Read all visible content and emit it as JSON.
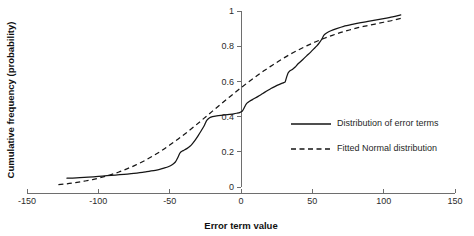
{
  "chart_data": {
    "type": "line",
    "title": "",
    "xlabel": "Error term value",
    "ylabel": "Cumulative frequency (probability)",
    "xlim": [
      -150,
      150
    ],
    "ylim": [
      0,
      1
    ],
    "xticks": [
      -150,
      -100,
      -50,
      0,
      50,
      100,
      150
    ],
    "xticklabels": [
      "-150",
      "-100",
      "-50",
      "0",
      "50",
      "100",
      "150"
    ],
    "yticks": [
      0,
      0.2,
      0.4,
      0.6,
      0.8,
      1
    ],
    "yticklabels": [
      "0",
      "0.2",
      "0.4",
      "0.6",
      "0.8",
      "1"
    ],
    "grid": false,
    "legend_position": "center-right",
    "line_color": "#151515",
    "axis_color": "#6e6e6e",
    "series": [
      {
        "name": "Distribution of error terms",
        "style": "solid",
        "x": [
          -122,
          -118,
          -113,
          -107,
          -100,
          -94,
          -88,
          -82,
          -77,
          -73,
          -69,
          -66,
          -63,
          -60,
          -57,
          -54,
          -51,
          -48,
          -46,
          -45,
          -44,
          -43,
          -42,
          -41,
          -40,
          -38,
          -36,
          -34,
          -32,
          -30,
          -28,
          -26,
          -25,
          -24,
          -22,
          -20,
          -17,
          -14,
          -11,
          -8,
          -5,
          -3,
          -1,
          1,
          2,
          3,
          4,
          6,
          9,
          12,
          15,
          18,
          21,
          24,
          27,
          29,
          30,
          31,
          32,
          33,
          34,
          36,
          38,
          40,
          43,
          46,
          49,
          51,
          53,
          55,
          57,
          58,
          60,
          63,
          67,
          72,
          78,
          84,
          90,
          96,
          102,
          107,
          110,
          112
        ],
        "y": [
          0.05,
          0.051,
          0.053,
          0.056,
          0.06,
          0.064,
          0.068,
          0.072,
          0.076,
          0.079,
          0.083,
          0.087,
          0.091,
          0.095,
          0.1,
          0.107,
          0.115,
          0.128,
          0.142,
          0.156,
          0.172,
          0.19,
          0.2,
          0.205,
          0.209,
          0.218,
          0.23,
          0.247,
          0.268,
          0.292,
          0.318,
          0.345,
          0.362,
          0.378,
          0.393,
          0.4,
          0.404,
          0.407,
          0.41,
          0.413,
          0.416,
          0.419,
          0.423,
          0.432,
          0.446,
          0.462,
          0.475,
          0.487,
          0.501,
          0.515,
          0.53,
          0.545,
          0.56,
          0.572,
          0.583,
          0.59,
          0.593,
          0.598,
          0.625,
          0.648,
          0.658,
          0.668,
          0.682,
          0.7,
          0.722,
          0.745,
          0.768,
          0.785,
          0.8,
          0.82,
          0.845,
          0.862,
          0.875,
          0.888,
          0.9,
          0.913,
          0.924,
          0.934,
          0.942,
          0.951,
          0.96,
          0.968,
          0.974,
          0.978
        ]
      },
      {
        "name": "Fitted Normal distribution",
        "style": "dashed",
        "x": [
          -128,
          -122,
          -116,
          -110,
          -104,
          -98,
          -92,
          -86,
          -80,
          -74,
          -68,
          -62,
          -56,
          -50,
          -44,
          -38,
          -32,
          -26,
          -20,
          -14,
          -8,
          -2,
          4,
          10,
          16,
          22,
          28,
          34,
          40,
          46,
          52,
          58,
          64,
          70,
          76,
          82,
          88,
          94,
          100,
          106,
          112
        ],
        "y": [
          0.013,
          0.018,
          0.025,
          0.033,
          0.042,
          0.054,
          0.068,
          0.084,
          0.103,
          0.124,
          0.148,
          0.175,
          0.205,
          0.238,
          0.273,
          0.31,
          0.349,
          0.39,
          0.431,
          0.472,
          0.512,
          0.551,
          0.589,
          0.625,
          0.66,
          0.692,
          0.723,
          0.752,
          0.778,
          0.802,
          0.824,
          0.844,
          0.862,
          0.878,
          0.892,
          0.905,
          0.916,
          0.926,
          0.936,
          0.946,
          0.958
        ]
      }
    ]
  },
  "legend": {
    "entries": [
      {
        "label": "Distribution of error terms",
        "style": "solid"
      },
      {
        "label": "Fitted Normal distribution",
        "style": "dashed"
      }
    ]
  }
}
